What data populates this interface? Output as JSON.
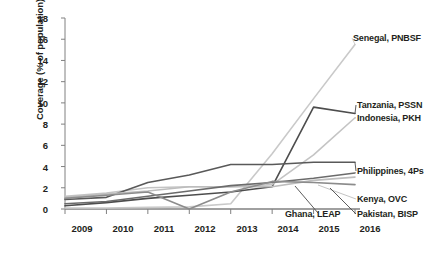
{
  "chart_data": {
    "type": "line",
    "title": "",
    "xlabel": "",
    "ylabel": "Coverage (% of population)",
    "x": [
      2009,
      2010,
      2011,
      2012,
      2013,
      2014,
      2015,
      2016
    ],
    "xtick_labels": [
      "2009",
      "2010",
      "2011",
      "2012",
      "2013",
      "2014",
      "2015",
      "2016"
    ],
    "ytick_labels": [
      "0",
      "2",
      "4",
      "6",
      "8",
      "10",
      "12",
      "14",
      "16",
      "18"
    ],
    "ytick_values": [
      0,
      2,
      4,
      6,
      8,
      10,
      12,
      14,
      16,
      18
    ],
    "ylim": [
      0,
      18
    ],
    "xlim": [
      2009,
      2016
    ],
    "grid": false,
    "legend_position": "right-inline-labels",
    "series": [
      {
        "name": "Senegal, PNBSF",
        "label": "Senegal, PNBSF",
        "color": "#c9c9c9",
        "values": [
          0.1,
          0.1,
          0.15,
          0.2,
          0.5,
          5.2,
          10.4,
          15.5
        ]
      },
      {
        "name": "Tanzania, PSSN",
        "label": "Tanzania, PSSN",
        "color": "#4d4d4d",
        "values": [
          0.3,
          0.6,
          1.0,
          1.3,
          1.6,
          2.1,
          9.6,
          9.0
        ]
      },
      {
        "name": "Indonesia, PKH",
        "label": "Indonesia, PKH",
        "color": "#c4c4c4",
        "values": [
          1.2,
          1.5,
          2.0,
          2.1,
          2.1,
          2.3,
          5.1,
          8.6
        ]
      },
      {
        "name": "Philippines, 4Ps",
        "label": "Philippines, 4Ps",
        "color": "#595959",
        "values": [
          0.9,
          1.1,
          2.5,
          3.2,
          4.2,
          4.2,
          4.4,
          4.4
        ]
      },
      {
        "name": "Kenya, OVC",
        "label": "Kenya, OVC",
        "color": "#bdbdbd",
        "values": [
          1.1,
          1.4,
          1.7,
          2.1,
          2.1,
          2.1,
          2.7,
          3.0
        ]
      },
      {
        "name": "Pakistan, BISP",
        "label": "Pakistan, BISP",
        "color": "#6b6b6b",
        "values": [
          0.5,
          0.7,
          1.2,
          1.7,
          2.2,
          2.5,
          2.9,
          3.4
        ]
      },
      {
        "name": "Ghana, LEAP",
        "label": "Ghana, LEAP",
        "color": "#8c8c8c",
        "values": [
          1.0,
          1.3,
          1.6,
          0.0,
          1.6,
          2.6,
          2.5,
          2.3
        ]
      }
    ],
    "label_colors": {
      "senegal": "#c9c9c9",
      "tanzania": "#231f20",
      "indonesia": "#c4c4c4",
      "philippines": "#231f20",
      "kenya": "#bdbdbd",
      "pakistan": "#231f20",
      "ghana": "#9a9a9a"
    },
    "axis_color": "#808080"
  }
}
